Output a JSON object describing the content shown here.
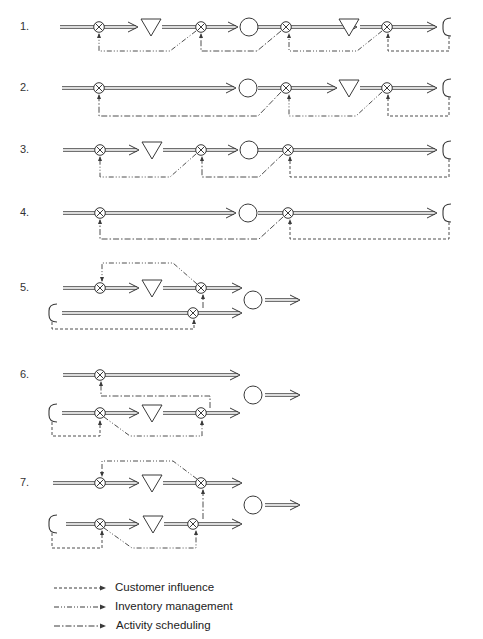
{
  "rows": [
    {
      "label": "1.",
      "y": 27
    },
    {
      "label": "2.",
      "y": 88
    },
    {
      "label": "3.",
      "y": 150
    },
    {
      "label": "4.",
      "y": 213
    },
    {
      "label": "5.",
      "y": 288
    },
    {
      "label": "6.",
      "y": 375
    },
    {
      "label": "7.",
      "y": 483
    }
  ],
  "legend": [
    {
      "label": "Customer influence",
      "style": "dashed"
    },
    {
      "label": "Inventory management",
      "style": "dash-dot-dot"
    },
    {
      "label": "Activity scheduling",
      "style": "dash-dot"
    }
  ],
  "symbols": {
    "activity": "circle-with-x (process step)",
    "inventory": "inverted triangle (stock)",
    "customer_contact": "open circle",
    "customer": "C-shaped bracket"
  },
  "colors": {
    "ink": "#3a3a3a",
    "background": "#ffffff"
  }
}
